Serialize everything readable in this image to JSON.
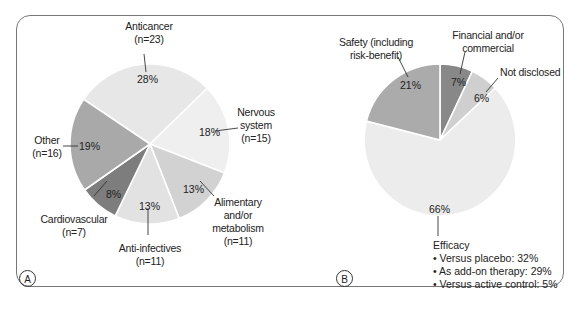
{
  "chart_data": [
    {
      "panel": "A",
      "type": "pie",
      "title": "",
      "slices": [
        {
          "label": "Anticancer",
          "n": "(n=23)",
          "value": 28,
          "pct_label": "28%",
          "color": "#e7e7e7"
        },
        {
          "label": "Nervous system",
          "n": "(n=15)",
          "value": 18,
          "pct_label": "18%",
          "color": "#efefef"
        },
        {
          "label": "Alimentary and/or metabolism",
          "n": "(n=11)",
          "value": 13,
          "pct_label": "13%",
          "color": "#d2d2d2"
        },
        {
          "label": "Anti-infectives",
          "n": "(n=11)",
          "value": 13,
          "pct_label": "13%",
          "color": "#e2e2e2"
        },
        {
          "label": "Cardiovascular",
          "n": "(n=7)",
          "value": 8,
          "pct_label": "8%",
          "color": "#7d7d7d"
        },
        {
          "label": "Other",
          "n": "(n=16)",
          "value": 19,
          "pct_label": "19%",
          "color": "#a9a9a9"
        }
      ]
    },
    {
      "panel": "B",
      "type": "pie",
      "title": "",
      "slices": [
        {
          "label": "Financial and/or commercial",
          "value": 7,
          "pct_label": "7%",
          "color": "#888888"
        },
        {
          "label": "Not disclosed",
          "value": 6,
          "pct_label": "6%",
          "color": "#cfcfcf"
        },
        {
          "label": "Efficacy",
          "value": 66,
          "pct_label": "66%",
          "color": "#ececec",
          "breakdown": [
            "• Versus placebo: 32%",
            "• As add-on therapy: 29%",
            "• Versus active control: 5%"
          ]
        },
        {
          "label": "Safety (including risk-benefit)",
          "value": 21,
          "pct_label": "21%",
          "color": "#ababab"
        }
      ]
    }
  ],
  "panels": {
    "a": {
      "tag": "A",
      "labels": {
        "anticancer": "Anticancer",
        "anticancer_n": "(n=23)",
        "anticancer_pct": "28%",
        "nervous_1": "Nervous",
        "nervous_2": "system",
        "nervous_n": "(n=15)",
        "nervous_pct": "18%",
        "alimentary_1": "Alimentary",
        "alimentary_2": "and/or",
        "alimentary_3": "metabolism",
        "alimentary_n": "(n=11)",
        "alimentary_pct": "13%",
        "antiinf": "Anti-infectives",
        "antiinf_n": "(n=11)",
        "antiinf_pct": "13%",
        "cardio": "Cardiovascular",
        "cardio_n": "(n=7)",
        "cardio_pct": "8%",
        "other": "Other",
        "other_n": "(n=16)",
        "other_pct": "19%"
      }
    },
    "b": {
      "tag": "B",
      "labels": {
        "safety_1": "Safety (including",
        "safety_2": "risk-benefit)",
        "safety_pct": "21%",
        "financial_1": "Financial and/or",
        "financial_2": "commercial",
        "financial_pct": "7%",
        "notdisc": "Not disclosed",
        "notdisc_pct": "6%",
        "efficacy_pct": "66%",
        "efficacy": "Efficacy",
        "eff_1": "• Versus placebo: 32%",
        "eff_2": "• As add-on therapy: 29%",
        "eff_3": "• Versus active control: 5%"
      }
    }
  }
}
